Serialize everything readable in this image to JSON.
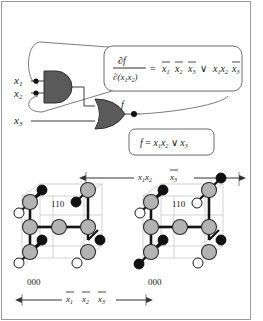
{
  "figure": {
    "border_color": "#8c8c8c",
    "gate_fill": "#5a5a5a",
    "node_fill": "#b3b3b3",
    "black_node_fill": "#111111",
    "white_node_fill": "#ffffff",
    "wire_color": "#3a3a3a",
    "grid_color": "#c8c8c8"
  },
  "circuit": {
    "inputs": [
      {
        "id": "x1",
        "label": "x",
        "sub": "1"
      },
      {
        "id": "x2",
        "label": "x",
        "sub": "2"
      },
      {
        "id": "x3",
        "label": "x",
        "sub": "3"
      }
    ],
    "and_gate": {
      "name": "and-gate",
      "inputs": [
        "x1",
        "x2"
      ]
    },
    "or_gate": {
      "name": "or-gate",
      "inputs": [
        "and-gate-output",
        "x3"
      ]
    },
    "output": {
      "label": "f"
    }
  },
  "callouts": {
    "derivative": {
      "numerator": "∂f",
      "denominator_prefix": "∂(x",
      "denominator_sub1": "1",
      "denominator_mid": "x",
      "denominator_sub2": "2",
      "denominator_suffix": ")",
      "equals": "=",
      "terms": [
        {
          "var": "x",
          "sub": "1",
          "bar": true
        },
        {
          "var": "x",
          "sub": "2",
          "bar": true
        },
        {
          "var": "x",
          "sub": "3",
          "bar": true
        }
      ],
      "or_symbol": "∨",
      "terms2": [
        {
          "var": "x",
          "sub": "1",
          "bar": false
        },
        {
          "var": "x",
          "sub": "2",
          "bar": false
        },
        {
          "var": "x",
          "sub": "3",
          "bar": true
        }
      ],
      "plain_text": "∂f/∂(x1x2) = x̅1 x̅2 x̅3 ∨ x1x2 x̅3"
    },
    "function": {
      "lhs": "f",
      "equals": "=",
      "terms": [
        {
          "var": "x",
          "sub": "1",
          "bar": false
        },
        {
          "var": "x",
          "sub": "2",
          "bar": false
        }
      ],
      "or_symbol": "∨",
      "terms2": [
        {
          "var": "x",
          "sub": "3",
          "bar": false
        }
      ],
      "plain_text": "f = x1x2 ∨ x3"
    }
  },
  "cubes": {
    "top_arrow_label": {
      "terms": [
        {
          "var": "x",
          "sub": "1",
          "bar": false
        },
        {
          "var": "x",
          "sub": "2",
          "bar": false
        },
        {
          "var": "x",
          "sub": "3",
          "bar": true
        }
      ],
      "plain_text": "x1x2 x̅3"
    },
    "bottom_arrow_label": {
      "terms": [
        {
          "var": "x",
          "sub": "1",
          "bar": true
        },
        {
          "var": "x",
          "sub": "2",
          "bar": true
        },
        {
          "var": "x",
          "sub": "3",
          "bar": true
        }
      ],
      "plain_text": "x̅1 x̅2 x̅3"
    },
    "left": {
      "name": "left-cube",
      "corner_labels": {
        "top": "110",
        "bottom": "000"
      }
    },
    "right": {
      "name": "right-cube",
      "corner_labels": {
        "top": "110",
        "bottom": "000"
      }
    }
  }
}
